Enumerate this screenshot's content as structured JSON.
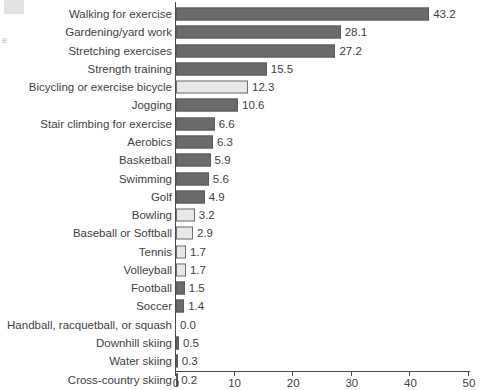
{
  "chart_data": {
    "type": "bar",
    "orientation": "horizontal",
    "title": "",
    "subtitle": "",
    "xlabel": "",
    "ylabel": "",
    "xlim": [
      0,
      50
    ],
    "xticks": [
      0,
      10,
      20,
      30,
      40,
      50
    ],
    "xtick_labels": [
      "0",
      "10",
      "20",
      "30",
      "40",
      "50"
    ],
    "grid": false,
    "legend": null,
    "categories": [
      "Walking for exercise",
      "Gardening/yard work",
      "Stretching exercises",
      "Strength training",
      "Bicycling or exercise bicycle",
      "Jogging",
      "Stair climbing for exercise",
      "Aerobics",
      "Basketball",
      "Swimming",
      "Golf",
      "Bowling",
      "Baseball or Softball",
      "Tennis",
      "Volleyball",
      "Football",
      "Soccer",
      "Handball, racquetball, or squash",
      "Downhill skiing",
      "Water skiing",
      "Cross-country skiing"
    ],
    "values": [
      43.2,
      28.1,
      27.2,
      15.5,
      12.3,
      10.6,
      6.6,
      6.3,
      5.9,
      5.6,
      4.9,
      3.2,
      2.9,
      1.7,
      1.7,
      1.5,
      1.4,
      0.0,
      0.5,
      0.3,
      0.2
    ],
    "value_labels": [
      "43.2",
      "28.1",
      "27.2",
      "15.5",
      "12.3",
      "10.6",
      "6.6",
      "6.3",
      "5.9",
      "5.6",
      "4.9",
      "3.2",
      "2.9",
      "1.7",
      "1.7",
      "1.5",
      "1.4",
      "0.0",
      "0.5",
      "0.3",
      "0.2"
    ],
    "bar_styles": [
      "dark",
      "dark",
      "dark",
      "dark",
      "light",
      "dark",
      "dark",
      "dark",
      "dark",
      "dark",
      "dark",
      "light",
      "light",
      "light",
      "light",
      "dark",
      "dark",
      "dark",
      "dark",
      "dark",
      "dark"
    ],
    "colors": {
      "bar_dark": "#6b6b6b",
      "bar_dark_edge": "#5a5a5a",
      "bar_light": "#e8e8e8",
      "bar_light_edge": "#6e6e6e",
      "axis": "#4a4a4a",
      "text": "#3f3f3f",
      "background": "#ffffff"
    }
  },
  "artifacts": {
    "left_margin_glyph": "e"
  }
}
